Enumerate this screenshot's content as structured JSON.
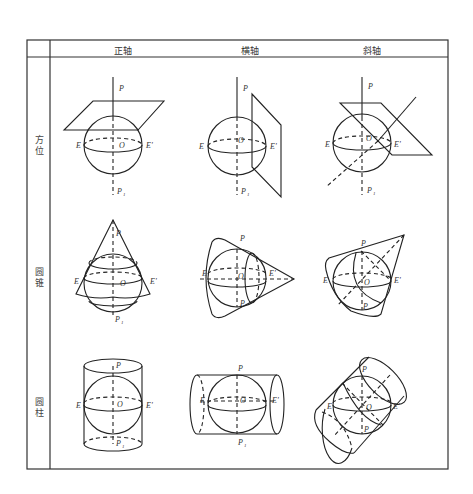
{
  "table": {
    "header": {
      "corner": "",
      "columns": [
        "正轴",
        "横轴",
        "斜轴"
      ]
    },
    "rows": [
      {
        "label": "方位",
        "label_chars": [
          "方",
          "位"
        ],
        "cells": [
          "正轴方位投影",
          "横轴方位投影",
          "斜轴方位投影"
        ]
      },
      {
        "label": "圆锥",
        "label_chars": [
          "圆",
          "锥"
        ],
        "cells": [
          "正轴圆锥投影",
          "横轴圆锥投影",
          "斜轴圆锥投影"
        ]
      },
      {
        "label": "圆柱",
        "label_chars": [
          "圆",
          "柱"
        ],
        "cells": [
          "正轴圆柱投影",
          "横轴圆柱投影",
          "斜轴圆柱投影"
        ]
      }
    ]
  },
  "labels": {
    "north_pole": "P",
    "south_pole": "P",
    "south_pole_sub": "1",
    "center": "O",
    "equator_west": "E",
    "equator_east": "E'"
  },
  "colors": {
    "line": "#222222",
    "border": "#333333",
    "background": "#ffffff"
  }
}
